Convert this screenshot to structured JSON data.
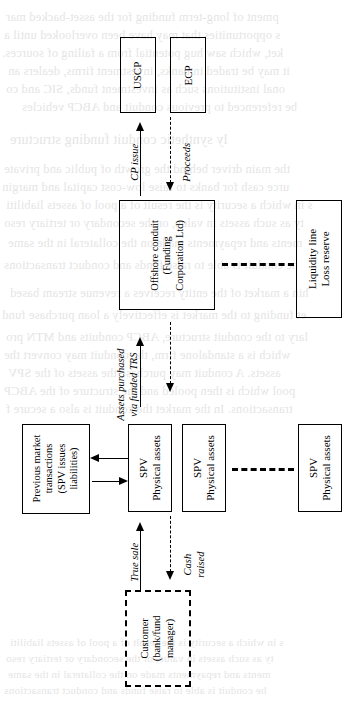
{
  "page": {
    "width": 364,
    "height": 726,
    "background_color": "#ffffff",
    "ink_color": "#000000",
    "orientation": "landscape diagram rotated 90 degrees on a portrait scanned page"
  },
  "diagram": {
    "title": "",
    "nodes": [
      {
        "id": "uscp",
        "label": "USCP",
        "border": "solid"
      },
      {
        "id": "ecp",
        "label": "ECP",
        "border": "solid"
      },
      {
        "id": "conduit",
        "label": "Offshore conduit\n(Funding\nCorporation Ltd)",
        "border": "solid",
        "lines": [
          "Offshore conduit",
          "(Funding",
          "Corporation Ltd)"
        ]
      },
      {
        "id": "liquidity",
        "label": "Liquidity line\nLoss reserve",
        "border": "solid",
        "lines": [
          "Liquidity line",
          "Loss reserve"
        ]
      },
      {
        "id": "prev",
        "label": "Previous market\ntransactions\n(SPV issues\nliabilities)",
        "border": "solid",
        "lines": [
          "Previous market",
          "transactions",
          "(SPV issues",
          "liabilities)"
        ]
      },
      {
        "id": "spv1",
        "label": "SPV\nPhysical assets",
        "border": "solid",
        "lines": [
          "SPV",
          "Physical assets"
        ]
      },
      {
        "id": "spv2",
        "label": "SPV\nPhysical assets",
        "border": "solid",
        "lines": [
          "SPV",
          "Physical assets"
        ]
      },
      {
        "id": "spv3",
        "label": "SPV\nPhysical assets",
        "border": "solid",
        "lines": [
          "SPV",
          "Physical assets"
        ]
      },
      {
        "id": "customer",
        "label": "Customer\n(bank/fund\nmanager)",
        "border": "dashed",
        "lines": [
          "Customer",
          "(bank/fund",
          "manager)"
        ]
      }
    ],
    "edge_labels": [
      {
        "id": "cp_issue",
        "text": "CP issue",
        "style": "italic",
        "arrow": "solid"
      },
      {
        "id": "proceeds",
        "text": "Proceeds",
        "style": "italic",
        "arrow": "dashed"
      },
      {
        "id": "assets_trs",
        "text": "Assets purchased\nvia funded TRS",
        "style": "italic",
        "arrow": "solid+dashed",
        "lines": [
          "Assets purchased",
          "via funded TRS"
        ]
      },
      {
        "id": "true_sale",
        "text": "True sale",
        "style": "italic",
        "arrow": "solid"
      },
      {
        "id": "cash_raised",
        "text": "Cash\nraised",
        "style": "italic",
        "arrow": "dashed",
        "lines": [
          "Cash",
          "raised"
        ]
      }
    ]
  },
  "ghost_text": {
    "note": "faint show-through text from the reverse side of the printed page; mirrored and unreadable",
    "lines": [
      "pment of long-term funding for the asset-backed mar",
      "s opportunities that may have been overlooked until a",
      "ket, which saw hug potential from a failing of sources.",
      "it may be traded in banks, investment firms, dealers an",
      "onal institutions such as investment funds, SIC and co",
      "be referenced to previous conduit and ABCP vehicles",
      "ly synthetic conduit funding structure",
      "the main driver behind the growth of public and private",
      "urce cash for banks to raise low-cost capital and margin",
      "s in which a security is the result of a pool of assets liabiliti",
      "ty as such assets in value, or the secondary or tertiary reso",
      "ments and repayments made on the collateral in the same",
      "he conduit is able to raise funds and conduct transactions",
      "hin a market of the entity receives a revenue stream based",
      "et funding to the market is effectively a loan purchase fund",
      "lary to the conduit structure, ABCP conduits and MTN pro",
      "which is a standalone firm, the conduit may convert the",
      "assets. A conduit may purchase the assets of the SPV",
      "pool which is then pooled and the structure of the ABCP",
      "transactions. In the market the conduit is also a secure f"
    ]
  }
}
